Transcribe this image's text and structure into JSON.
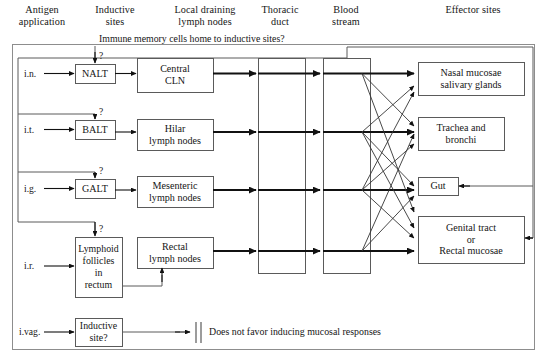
{
  "figure": {
    "annotation": "Immune memory cells home to inductive sites?",
    "no_favor_note": "Does not favor inducing mucosal responses",
    "line_color": "#4a4a4a",
    "arrow_color": "#111111",
    "box_border_color": "#777777",
    "text_color": "#151515"
  },
  "columns": [
    {
      "id": "antigen-application",
      "line1": "Antigen",
      "line2": "application"
    },
    {
      "id": "inductive-sites",
      "line1": "Inductive",
      "line2": "sites"
    },
    {
      "id": "local-draining",
      "line1": "Local draining",
      "line2": "lymph nodes"
    },
    {
      "id": "thoracic-duct",
      "line1": "Thoracic",
      "line2": "duct"
    },
    {
      "id": "blood-stream",
      "line1": "Blood",
      "line2": "stream"
    },
    {
      "id": "effector-sites",
      "line1": "Effector sites",
      "line2": ""
    }
  ],
  "routes": [
    {
      "id": "nasal",
      "application": "i.n.",
      "inductive": "NALT",
      "lymph_l1": "Central",
      "lymph_l2": "CLN",
      "question": "?"
    },
    {
      "id": "broncho",
      "application": "i.t.",
      "inductive": "BALT",
      "lymph_l1": "Hilar",
      "lymph_l2": "lymph nodes",
      "question": "?"
    },
    {
      "id": "gut",
      "application": "i.g.",
      "inductive": "GALT",
      "lymph_l1": "Mesenteric",
      "lymph_l2": "lymph nodes",
      "question": "?"
    },
    {
      "id": "rectal",
      "application": "i.r.",
      "inductive": "Lymphoid follicles in rectum",
      "lymph_l1": "Rectal",
      "lymph_l2": "lymph nodes",
      "question": "?"
    },
    {
      "id": "vaginal",
      "application": "i.vag.",
      "inductive": "Inductive site?",
      "lymph_l1": "",
      "lymph_l2": "",
      "question": ""
    }
  ],
  "inductive_sites": [
    {
      "id": "nalt",
      "label": "NALT"
    },
    {
      "id": "balt",
      "label": "BALT"
    },
    {
      "id": "galt",
      "label": "GALT"
    },
    {
      "id": "rectum",
      "l1": "Lymphoid",
      "l2": "follicles",
      "l3": "in",
      "l4": "rectum"
    },
    {
      "id": "vaginal",
      "l1": "Inductive",
      "l2": "site?"
    }
  ],
  "lymph_nodes": [
    {
      "id": "central-cln",
      "l1": "Central",
      "l2": "CLN"
    },
    {
      "id": "hilar-ln",
      "l1": "Hilar",
      "l2": "lymph nodes"
    },
    {
      "id": "mesenteric-ln",
      "l1": "Mesenteric",
      "l2": "lymph nodes"
    },
    {
      "id": "rectal-ln",
      "l1": "Rectal",
      "l2": "lymph nodes"
    }
  ],
  "effector_sites": [
    {
      "id": "nasal-mucosae",
      "l1": "Nasal mucosae",
      "l2": "salivary glands",
      "l3": ""
    },
    {
      "id": "trachea",
      "l1": "Trachea and",
      "l2": "bronchi",
      "l3": ""
    },
    {
      "id": "gut",
      "l1": "Gut",
      "l2": "",
      "l3": ""
    },
    {
      "id": "genital-rectal",
      "l1": "Genital tract",
      "l2": "or",
      "l3": "Rectal mucosae"
    }
  ],
  "questions": {
    "nalt": "?",
    "balt": "?",
    "galt": "?",
    "rectum": "?"
  }
}
